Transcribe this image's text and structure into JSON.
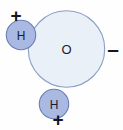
{
  "diagram": {
    "background_color": "#fefefe",
    "canvas": {
      "width": 123,
      "height": 130
    },
    "atoms": [
      {
        "name": "oxygen",
        "label": "O",
        "cx": 66.5,
        "cy": 49,
        "r": 38.5,
        "fill": "#e9f0f8",
        "stroke": "#8c9fc6",
        "label_color": "#1a1d2e"
      },
      {
        "name": "hydrogen-upper-left",
        "label": "H",
        "cx": 21,
        "cy": 35,
        "r": 15,
        "fill": "#a9b9e1",
        "stroke": "#6c7fb4",
        "label_color": "#1a1d2e"
      },
      {
        "name": "hydrogen-lower",
        "label": "H",
        "cx": 54,
        "cy": 104,
        "r": 15,
        "fill": "#a9b9e1",
        "stroke": "#6c7fb4",
        "label_color": "#1a1d2e"
      }
    ],
    "charges": [
      {
        "name": "partial-positive-upper-left",
        "sign": "+",
        "x": 16,
        "y": 15,
        "color": "#15161f"
      },
      {
        "name": "partial-negative-right",
        "sign": "–",
        "x": 113,
        "y": 48,
        "color": "#15161f"
      },
      {
        "name": "partial-positive-lower",
        "sign": "+",
        "x": 58,
        "y": 119,
        "color": "#15161f"
      }
    ]
  }
}
